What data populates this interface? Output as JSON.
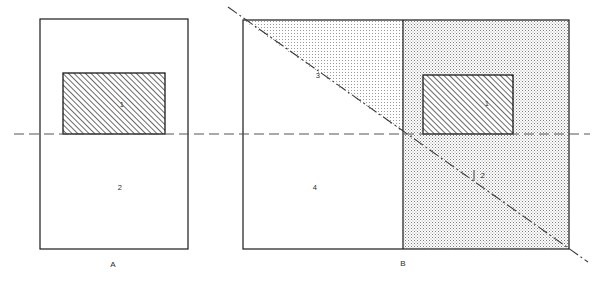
{
  "figure": {
    "type": "engineering-cross-section-diagram",
    "background_color": "#ffffff",
    "line_color": "#1a1a1a",
    "centerline_color": "#555555",
    "stipple_color": "#8a8a8a",
    "hatch_color": "#1a1a1a",
    "panels": [
      {
        "id": "panel-a",
        "caption": "A",
        "caption_x": 113,
        "caption_y": 265,
        "outline": {
          "x": 40,
          "y": 19,
          "width": 148,
          "height": 230
        },
        "regions": [
          {
            "name": "hatched-block",
            "label": "1",
            "label_x": 122,
            "label_y": 105,
            "fill": "hatch"
          },
          {
            "name": "lower-body",
            "label": "2",
            "label_x": 120,
            "label_y": 188,
            "fill": "none"
          }
        ]
      },
      {
        "id": "panel-b",
        "caption": "B",
        "caption_x": 403,
        "caption_y": 264,
        "outline": {
          "x": 243,
          "y": 20,
          "width": 326,
          "height": 229
        },
        "regions": [
          {
            "name": "hatched-block",
            "label": "1",
            "label_x": 487,
            "label_y": 104,
            "fill": "hatch"
          },
          {
            "name": "stipple-lower-right",
            "label": "2",
            "label_x": 483,
            "label_y": 176,
            "fill": "stipple"
          },
          {
            "name": "stipple-upper-left",
            "label": "3",
            "label_x": 318,
            "label_y": 76,
            "fill": "stipple"
          },
          {
            "name": "clear-lower-left",
            "label": "4",
            "label_x": 315,
            "label_y": 188,
            "fill": "none"
          }
        ]
      }
    ],
    "centerline": {
      "name": "horizontal-centerline",
      "y": 134,
      "x_start": 14,
      "x_end": 590,
      "style": "dashed"
    },
    "diagonal": {
      "name": "diagonal-dash-dot-line",
      "x1": 228,
      "y1": 7,
      "x2": 588,
      "y2": 262,
      "style": "dash-dot"
    }
  },
  "labels": {
    "one": "1",
    "two": "2",
    "three": "3",
    "four": "4",
    "caption_a": "A",
    "caption_b": "B"
  }
}
